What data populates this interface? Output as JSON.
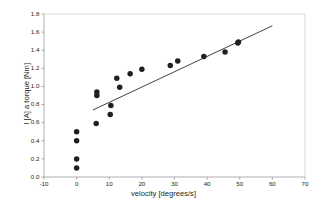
{
  "chart_data": {
    "type": "scatter",
    "title": "",
    "xlabel": "velocity [degrees/s]",
    "ylabel": "I [A] a torque [Nm]",
    "xlim": [
      -10,
      70
    ],
    "ylim": [
      0.0,
      1.8
    ],
    "xticks": [
      "-10",
      "0",
      "10",
      "20",
      "30",
      "40",
      "50",
      "60",
      "70"
    ],
    "xtick_values": [
      -10,
      0,
      10,
      20,
      30,
      40,
      50,
      60,
      70
    ],
    "yticks": [
      "0.0",
      "0.2",
      "0.4",
      "0.6",
      "0.8",
      "1.0",
      "1.2",
      "1.4",
      "1.6",
      "1.8"
    ],
    "ytick_values": [
      0.0,
      0.2,
      0.4,
      0.6,
      0.8,
      1.0,
      1.2,
      1.4,
      1.6,
      1.8
    ],
    "grid": false,
    "legend": null,
    "marker_color": "#231f20",
    "line_color": "#231f20",
    "frame_color": "#c9c9c9",
    "series": [
      {
        "name": "measurements",
        "marker": "filled-circle",
        "points": [
          [
            0.0,
            0.1
          ],
          [
            0.0,
            0.2
          ],
          [
            0.0,
            0.4
          ],
          [
            0.0,
            0.5
          ],
          [
            6.0,
            0.59
          ],
          [
            6.2,
            0.9
          ],
          [
            6.2,
            0.94
          ],
          [
            10.3,
            0.69
          ],
          [
            10.5,
            0.79
          ],
          [
            12.3,
            1.09
          ],
          [
            13.2,
            0.99
          ],
          [
            16.4,
            1.14
          ],
          [
            20.0,
            1.19
          ],
          [
            28.7,
            1.23
          ],
          [
            31.0,
            1.28
          ],
          [
            39.0,
            1.33
          ],
          [
            45.5,
            1.38
          ],
          [
            49.4,
            1.48
          ],
          [
            49.6,
            1.49
          ]
        ]
      }
    ],
    "trendline": {
      "name": "linear fit",
      "x_start": 5.0,
      "y_start": 0.74,
      "x_end": 60.0,
      "y_end": 1.67
    }
  }
}
